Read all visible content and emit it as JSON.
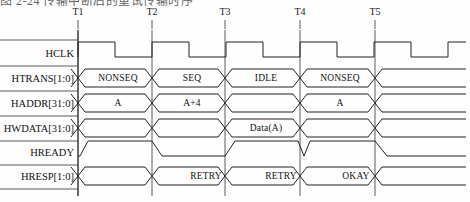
{
  "caption": {
    "text": "图 2-24  传输中断后的重试传输时序"
  },
  "diagram": {
    "time_markers": [
      {
        "label": "T1",
        "x": 78
      },
      {
        "label": "T2",
        "x": 152
      },
      {
        "label": "T3",
        "x": 225
      },
      {
        "label": "T4",
        "x": 300
      },
      {
        "label": "T5",
        "x": 375
      }
    ],
    "signals": [
      {
        "name": "HCLK",
        "label": "HCLK",
        "y": 53,
        "type": "clock"
      },
      {
        "name": "HTRANS",
        "label": "HTRANS[1:0]",
        "y": 78,
        "type": "bus"
      },
      {
        "name": "HADDR",
        "label": "HADDR[31:0]",
        "y": 103,
        "type": "bus"
      },
      {
        "name": "HWDATA",
        "label": "HWDATA[31:0]",
        "y": 128,
        "type": "bus"
      },
      {
        "name": "HREADY",
        "label": "HREADY",
        "y": 152,
        "type": "logic"
      },
      {
        "name": "HRESP",
        "label": "HRESP[1:0]",
        "y": 176,
        "type": "bus"
      }
    ],
    "bus_values": [
      {
        "signal": "HTRANS",
        "value": "NONSEQ",
        "x": 118,
        "y": 78
      },
      {
        "signal": "HTRANS",
        "value": "SEQ",
        "x": 192,
        "y": 78
      },
      {
        "signal": "HTRANS",
        "value": "IDLE",
        "x": 266,
        "y": 78
      },
      {
        "signal": "HTRANS",
        "value": "NONSEQ",
        "x": 340,
        "y": 78
      },
      {
        "signal": "HADDR",
        "value": "A",
        "x": 118,
        "y": 103
      },
      {
        "signal": "HADDR",
        "value": "A+4",
        "x": 192,
        "y": 103
      },
      {
        "signal": "HADDR",
        "value": "A",
        "x": 340,
        "y": 103
      },
      {
        "signal": "HWDATA",
        "value": "Data(A)",
        "x": 266,
        "y": 128
      },
      {
        "signal": "HRESP",
        "value": "RETRY",
        "x": 206,
        "y": 176
      },
      {
        "signal": "HRESP",
        "value": "RETRY",
        "x": 281,
        "y": 176
      },
      {
        "signal": "HRESP",
        "value": "OKAY",
        "x": 356,
        "y": 176
      }
    ],
    "colors": {
      "stroke": "#232323",
      "axis": "#333333",
      "text": "#111111",
      "background": "#fefefe"
    },
    "geometry": {
      "axis_x": 78,
      "right_edge": 466,
      "clock_high_offset": 0,
      "clock_period": 74,
      "bus_half_height": 9,
      "logic_high_offset": -11,
      "skew": 7
    }
  }
}
